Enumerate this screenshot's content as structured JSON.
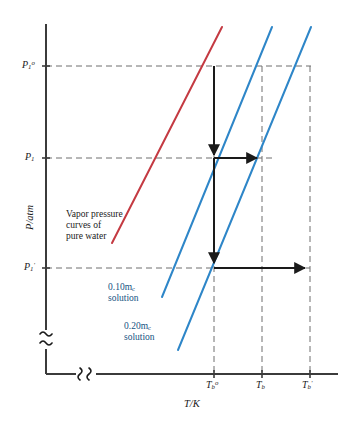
{
  "figure": {
    "kind": "vapor-pressure-boiling-point-elevation-diagram",
    "background": "#ffffff"
  },
  "axes": {
    "y_title": "P/atm",
    "x_title": "T/K",
    "axis_color": "#3b3b3b",
    "break_symbol": "≈",
    "y_ticks": [
      {
        "id": "p1_std",
        "label_html": "P<sub>1</sub><sup>o</sup>",
        "y": 66
      },
      {
        "id": "p1",
        "label_html": "P<sub>1</sub>",
        "y": 158
      },
      {
        "id": "p1_prime",
        "label_html": "P<sub>1</sub><sup>′</sup>",
        "y": 268
      }
    ],
    "x_ticks": [
      {
        "id": "tb_std",
        "label_html": "T<sub>b</sub><sup>o</sup>",
        "x": 214
      },
      {
        "id": "tb",
        "label_html": "T<sub>b</sub>",
        "x": 262
      },
      {
        "id": "tb_prime",
        "label_html": "T<sub>b</sub><sup>′</sup>",
        "x": 310
      }
    ]
  },
  "curves": [
    {
      "id": "pure-water",
      "label_lines": [
        "Vapor pressure",
        "curves of",
        "pure water"
      ],
      "color": "#c43a42",
      "x1": 112,
      "y1": 243,
      "x2": 222,
      "y2": 27
    },
    {
      "id": "solution-010",
      "label_lines": [
        "0.10m",
        "solution"
      ],
      "label_sub": "c",
      "color": "#2e86c8",
      "x1": 162,
      "y1": 297,
      "x2": 272,
      "y2": 27
    },
    {
      "id": "solution-020",
      "label_lines": [
        "0.20m",
        "solution"
      ],
      "label_sub": "c",
      "color": "#2e86c8",
      "x1": 178,
      "y1": 350,
      "x2": 311,
      "y2": 27
    }
  ],
  "annotations": {
    "pure_water_note": {
      "lines": [
        "Vapor pressure",
        "curves of",
        "pure water"
      ],
      "x": 66,
      "y": 210
    },
    "solution_010_note": {
      "lines": [
        "0.10m",
        "solution"
      ],
      "sub": "c",
      "x": 108,
      "y": 283
    },
    "solution_020_note": {
      "lines": [
        "0.20m",
        "solution"
      ],
      "sub": "c",
      "x": 124,
      "y": 322
    }
  },
  "arrows": {
    "color": "#1a1a1a",
    "vertical_drop": {
      "x": 214,
      "y_from": 66,
      "y_to": 268
    },
    "mid_head_y": 158,
    "horizontal": [
      {
        "id": "arrow-to-tb",
        "y": 158,
        "x_from": 214,
        "x_to": 262
      },
      {
        "id": "arrow-to-tb-prime",
        "y": 268,
        "x_from": 214,
        "x_to": 310
      }
    ]
  },
  "guides": {
    "color": "#6e6e6e",
    "horizontal": [
      {
        "y": 66,
        "x_from": 46,
        "x_to": 311
      },
      {
        "y": 158,
        "x_from": 46,
        "x_to": 272
      },
      {
        "y": 268,
        "x_from": 46,
        "x_to": 310
      }
    ],
    "vertical": [
      {
        "x": 214,
        "y_from": 66,
        "y_to": 374
      },
      {
        "x": 262,
        "y_from": 66,
        "y_to": 374
      },
      {
        "x": 310,
        "y_from": 66,
        "y_to": 374
      }
    ]
  }
}
